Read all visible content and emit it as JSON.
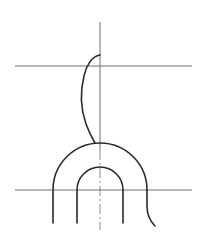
{
  "diagram": {
    "type": "technical-line-drawing",
    "colors": {
      "background": "#ffffff",
      "thin_line": "#6e6e6e",
      "thick_line": "#2a2a2a",
      "center_line": "#8a8a8a"
    },
    "axis": {
      "x": 100,
      "y_top": 22,
      "y_bottom": 230
    },
    "horizontal_lines": [
      {
        "y": 66,
        "x1": 15,
        "x2": 192
      },
      {
        "y": 190,
        "x1": 15,
        "x2": 192
      }
    ],
    "arches": [
      {
        "name": "outer",
        "cx": 100,
        "cy": 190,
        "r": 47,
        "leg_bottom": 223
      },
      {
        "name": "inner",
        "cx": 100,
        "cy": 190,
        "r": 23,
        "leg_bottom": 223
      }
    ],
    "labels": []
  }
}
